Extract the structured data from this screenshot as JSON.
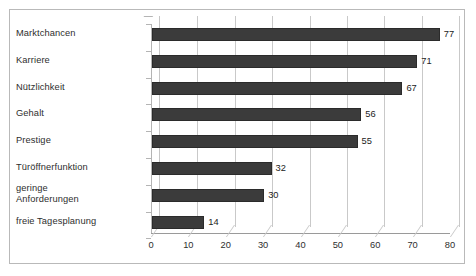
{
  "chart_data": {
    "type": "bar",
    "orientation": "horizontal",
    "title": "",
    "xlabel": "",
    "ylabel": "",
    "categories": [
      "Marktchancen",
      "Karriere",
      "Nützlichkeit",
      "Gehalt",
      "Prestige",
      "Türöffnerfunktion",
      "geringe Anforderungen",
      "freie Tagesplanung"
    ],
    "category_lines": [
      [
        "Marktchancen"
      ],
      [
        "Karriere"
      ],
      [
        "Nützlichkeit"
      ],
      [
        "Gehalt"
      ],
      [
        "Prestige"
      ],
      [
        "Türöffnerfunktion"
      ],
      [
        "geringe",
        "Anforderungen"
      ],
      [
        "freie Tagesplanung"
      ]
    ],
    "values": [
      77,
      71,
      67,
      56,
      55,
      32,
      30,
      14
    ],
    "data_labels": [
      "77",
      "71",
      "67",
      "56",
      "55",
      "32",
      "30",
      "14"
    ],
    "xlim": [
      0,
      80
    ],
    "xticks": [
      0,
      10,
      20,
      30,
      40,
      50,
      60,
      70,
      80
    ],
    "xtick_labels": [
      "0",
      "10",
      "20",
      "30",
      "40",
      "50",
      "60",
      "70",
      "80"
    ],
    "grid": true,
    "grid_axis": "x",
    "legend": false,
    "legend_position": "none",
    "style": "3d-bar",
    "bar_color": "#3b3b3b",
    "grid_color": "#c9c9c9",
    "axis_color": "#b4b4b4",
    "background_color": "#ffffff",
    "frame_color": "#b9b9b9"
  }
}
